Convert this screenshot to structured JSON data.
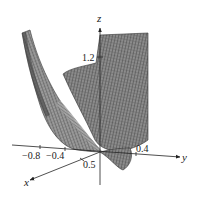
{
  "figure": {
    "type": "3d-surface-plot",
    "axes": {
      "x": {
        "label": "x",
        "ticks": [
          {
            "value": 0.5,
            "text": "0.5"
          }
        ]
      },
      "y": {
        "label": "y",
        "ticks": [
          {
            "value": -0.8,
            "text": "−0.8"
          },
          {
            "value": -0.4,
            "text": "−0.4"
          },
          {
            "value": 0.4,
            "text": "0.4"
          }
        ]
      },
      "z": {
        "label": "z",
        "ticks": [
          {
            "value": 1.2,
            "text": "1.2"
          }
        ]
      }
    },
    "colors": {
      "surface_fill": "#8a8a8a",
      "surface_dark": "#3a3a3a",
      "mesh_line": "#2a2a2a",
      "axis": "#222222",
      "background": "#ffffff"
    }
  }
}
